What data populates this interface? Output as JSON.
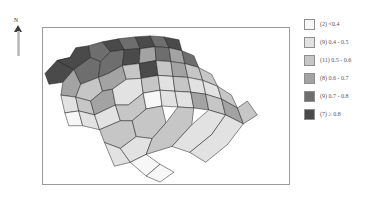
{
  "figure": {
    "background_color": "#ffffff",
    "panel_border_color": "#9a9a9a"
  },
  "north_arrow": {
    "label": "N",
    "name": "north-arrow"
  },
  "legend": {
    "position": "right",
    "entries": [
      {
        "count": 2,
        "label": "(2) <0.4",
        "color": "#f7f7f7",
        "range_min": null,
        "range_max": 0.4
      },
      {
        "count": 9,
        "label": "(9) 0.4 - 0.5",
        "color": "#e2e2e2",
        "range_min": 0.4,
        "range_max": 0.5
      },
      {
        "count": 11,
        "label": "(11) 0.5 - 0.6",
        "color": "#c6c6c6",
        "range_min": 0.5,
        "range_max": 0.6
      },
      {
        "count": 8,
        "label": "(8) 0.6 - 0.7",
        "color": "#a3a3a3",
        "range_min": 0.6,
        "range_max": 0.7
      },
      {
        "count": 9,
        "label": "(9) 0.7 - 0.8",
        "color": "#6e6e6e",
        "range_min": 0.7,
        "range_max": 0.8
      },
      {
        "count": 7,
        "label": "(7) ≥ 0.8",
        "color": "#4a4a4a",
        "range_min": 0.8,
        "range_max": null
      }
    ]
  },
  "chart_data": {
    "type": "heatmap",
    "subtype": "choropleth-map",
    "title": "",
    "xlabel": "",
    "ylabel": "",
    "region": "South Carolina counties",
    "total_regions": 46,
    "value_range": [
      0.0,
      1.0
    ],
    "classification": "6 classes, graduated grayscale",
    "legend_position": "right",
    "grid": false,
    "categories": [
      "<0.4",
      "0.4 - 0.5",
      "0.5 - 0.6",
      "0.6 - 0.7",
      "0.7 - 0.8",
      ">= 0.8"
    ],
    "values": [
      2,
      9,
      11,
      8,
      9,
      7
    ],
    "series": [
      {
        "name": "county count per class",
        "values": [
          2,
          9,
          11,
          8,
          9,
          7
        ]
      }
    ],
    "class_colors": [
      "#f7f7f7",
      "#e2e2e2",
      "#c6c6c6",
      "#a3a3a3",
      "#6e6e6e",
      "#4a4a4a"
    ],
    "spatial_pattern": "Darkest classes concentrated in the northwest (upstate); lightest classes along the northeast and southeast coastal plain",
    "regions": [
      {
        "id": "r1",
        "class": 5,
        "value": 0.85
      },
      {
        "id": "r2",
        "class": 5,
        "value": 0.86
      },
      {
        "id": "r3",
        "class": 4,
        "value": 0.76
      },
      {
        "id": "r4",
        "class": 5,
        "value": 0.83
      },
      {
        "id": "r5",
        "class": 4,
        "value": 0.74
      },
      {
        "id": "r6",
        "class": 5,
        "value": 0.88
      },
      {
        "id": "r7",
        "class": 4,
        "value": 0.78
      },
      {
        "id": "r8",
        "class": 5,
        "value": 0.82
      },
      {
        "id": "r9",
        "class": 4,
        "value": 0.72
      },
      {
        "id": "r10",
        "class": 4,
        "value": 0.75
      },
      {
        "id": "r11",
        "class": 5,
        "value": 0.81
      },
      {
        "id": "r12",
        "class": 3,
        "value": 0.66
      },
      {
        "id": "r13",
        "class": 4,
        "value": 0.77
      },
      {
        "id": "r14",
        "class": 3,
        "value": 0.64
      },
      {
        "id": "r15",
        "class": 4,
        "value": 0.73
      },
      {
        "id": "r16",
        "class": 3,
        "value": 0.68
      },
      {
        "id": "r17",
        "class": 2,
        "value": 0.56
      },
      {
        "id": "r18",
        "class": 3,
        "value": 0.62
      },
      {
        "id": "r19",
        "class": 2,
        "value": 0.54
      },
      {
        "id": "r20",
        "class": 5,
        "value": 0.84
      },
      {
        "id": "r21",
        "class": 2,
        "value": 0.58
      },
      {
        "id": "r22",
        "class": 3,
        "value": 0.63
      },
      {
        "id": "r23",
        "class": 2,
        "value": 0.52
      },
      {
        "id": "r24",
        "class": 2,
        "value": 0.57
      },
      {
        "id": "r25",
        "class": 1,
        "value": 0.46
      },
      {
        "id": "r26",
        "class": 2,
        "value": 0.55
      },
      {
        "id": "r27",
        "class": 3,
        "value": 0.61
      },
      {
        "id": "r28",
        "class": 1,
        "value": 0.44
      },
      {
        "id": "r29",
        "class": 2,
        "value": 0.53
      },
      {
        "id": "r30",
        "class": 1,
        "value": 0.47
      },
      {
        "id": "r31",
        "class": 2,
        "value": 0.59
      },
      {
        "id": "r32",
        "class": 1,
        "value": 0.42
      },
      {
        "id": "r33",
        "class": 1,
        "value": 0.48
      },
      {
        "id": "r34",
        "class": 2,
        "value": 0.51
      },
      {
        "id": "r35",
        "class": 0,
        "value": 0.36
      },
      {
        "id": "r36",
        "class": 1,
        "value": 0.45
      },
      {
        "id": "r37",
        "class": 1,
        "value": 0.43
      },
      {
        "id": "r38",
        "class": 2,
        "value": 0.55
      },
      {
        "id": "r39",
        "class": 0,
        "value": 0.38
      },
      {
        "id": "r40",
        "class": 1,
        "value": 0.49
      },
      {
        "id": "r41",
        "class": 1,
        "value": 0.41
      },
      {
        "id": "r42",
        "class": 3,
        "value": 0.67
      },
      {
        "id": "r43",
        "class": 2,
        "value": 0.58
      },
      {
        "id": "r44",
        "class": 3,
        "value": 0.65
      },
      {
        "id": "r45",
        "class": 2,
        "value": 0.56
      },
      {
        "id": "r46",
        "class": 2,
        "value": 0.53
      }
    ]
  }
}
